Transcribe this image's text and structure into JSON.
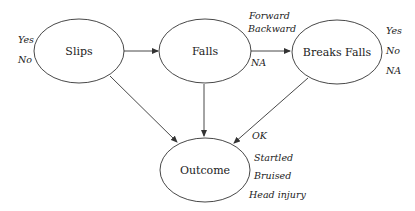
{
  "diagram": {
    "nodes": [
      {
        "id": "slips",
        "label": "Slips",
        "states": [
          "Yes",
          "No"
        ]
      },
      {
        "id": "falls",
        "label": "Falls",
        "states": [
          "Forward",
          "Backward",
          "NA"
        ]
      },
      {
        "id": "breaks_falls",
        "label": "Breaks Falls",
        "states": [
          "Yes",
          "No",
          "NA"
        ]
      },
      {
        "id": "outcome",
        "label": "Outcome",
        "states": [
          "OK",
          "Startled",
          "Bruised",
          "Head injury"
        ]
      }
    ],
    "edges": [
      {
        "from": "slips",
        "to": "falls"
      },
      {
        "from": "falls",
        "to": "breaks_falls"
      },
      {
        "from": "slips",
        "to": "outcome"
      },
      {
        "from": "falls",
        "to": "outcome"
      },
      {
        "from": "breaks_falls",
        "to": "outcome"
      }
    ]
  },
  "colors": {
    "stroke": "#333333",
    "text": "#222222",
    "background": "#ffffff"
  }
}
